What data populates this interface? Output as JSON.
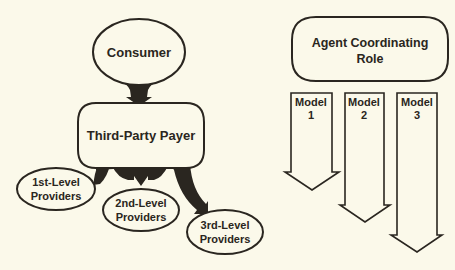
{
  "left_model": {
    "consumer": {
      "label": "Consumer"
    },
    "payer": {
      "label": "Third-Party Payer"
    },
    "providers": [
      {
        "line1": "1st-Level",
        "line2": "Providers"
      },
      {
        "line1": "2nd-Level",
        "line2": "Providers"
      },
      {
        "line1": "3rd-Level",
        "line2": "Providers"
      }
    ]
  },
  "right_model": {
    "coordinator": {
      "line1": "Agent Coordinating",
      "line2": "Role"
    },
    "models": [
      {
        "line1": "Model",
        "line2": "1"
      },
      {
        "line1": "Model",
        "line2": "2"
      },
      {
        "line1": "Model",
        "line2": "3"
      }
    ]
  },
  "colors": {
    "background": "#fbf9ea",
    "ink": "#2a2620"
  }
}
